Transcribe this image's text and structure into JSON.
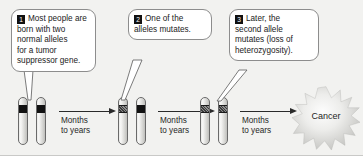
{
  "figure": {
    "background_color": "#f2f2f0"
  },
  "callouts": [
    {
      "number": "1",
      "text": "Most people are\nborn with two\nnormal alleles\nfor a tumor\nsuppressor gene."
    },
    {
      "number": "2",
      "text": "One of the\nalleles mutates."
    },
    {
      "number": "3",
      "text": "Later, the\nsecond allele\nmutates (loss of\nheterozygosity)."
    }
  ],
  "stages": [
    {
      "name": "stage-1-normal-pair",
      "left_allele": "normal",
      "right_allele": "normal"
    },
    {
      "name": "stage-2-one-mutated",
      "left_allele": "mutant",
      "right_allele": "normal"
    },
    {
      "name": "stage-3-both-mutated",
      "left_allele": "mutant",
      "right_allele": "mutant"
    }
  ],
  "arrows": [
    {
      "label": "Months\nto years"
    },
    {
      "label": "Months\nto years"
    },
    {
      "label": "Months\nto years"
    }
  ],
  "outcome": {
    "label": "Cancer"
  },
  "colors": {
    "normal_allele_band": "#121212",
    "mutant_allele_band": "#6a6a6a",
    "callout_border": "#8d8d8d",
    "badge_background": "#111111",
    "badge_text": "#ffffff",
    "arrow": "#2a2a2a",
    "text": "#1f1f1f"
  }
}
